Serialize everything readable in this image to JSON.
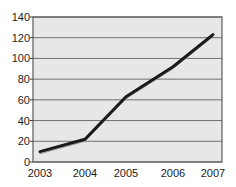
{
  "chart_data": {
    "type": "line",
    "title": "",
    "xlabel": "",
    "ylabel": "",
    "categories": [
      "2003",
      "2004",
      "2005",
      "2006",
      "2007"
    ],
    "values": [
      10,
      22,
      63,
      92,
      123
    ],
    "series": [
      {
        "name": "series-1",
        "values": [
          10,
          22,
          63,
          92,
          123
        ],
        "color": "#1a1a1a",
        "line_width": 3
      }
    ],
    "shadow_series": {
      "name": "series-1-shadow",
      "values": [
        8,
        20,
        61,
        90,
        121
      ],
      "color": "#9a9a9a",
      "line_width": 1
    },
    "ylim": [
      0,
      140
    ],
    "ytick_step": 20,
    "yticks": [
      "0",
      "20",
      "40",
      "60",
      "80",
      "100",
      "120",
      "140"
    ],
    "xticks": [
      "2003",
      "2004",
      "2005",
      "2006",
      "2007"
    ],
    "grid": true,
    "grid_axis": "y",
    "grid_color": "#6f6f6f",
    "plot_background": "#e7e7e7",
    "plot_border_color": "#5c5c5c",
    "legend": null,
    "legend_position": "none",
    "annotations": []
  },
  "layout": {
    "plot_left": 33,
    "plot_top": 17,
    "plot_right": 222,
    "plot_bottom": 162,
    "x_positions": [
      40,
      85,
      126,
      173,
      213
    ],
    "y_label_positions": [
      17,
      38,
      58,
      79,
      99,
      120,
      141,
      162
    ]
  }
}
